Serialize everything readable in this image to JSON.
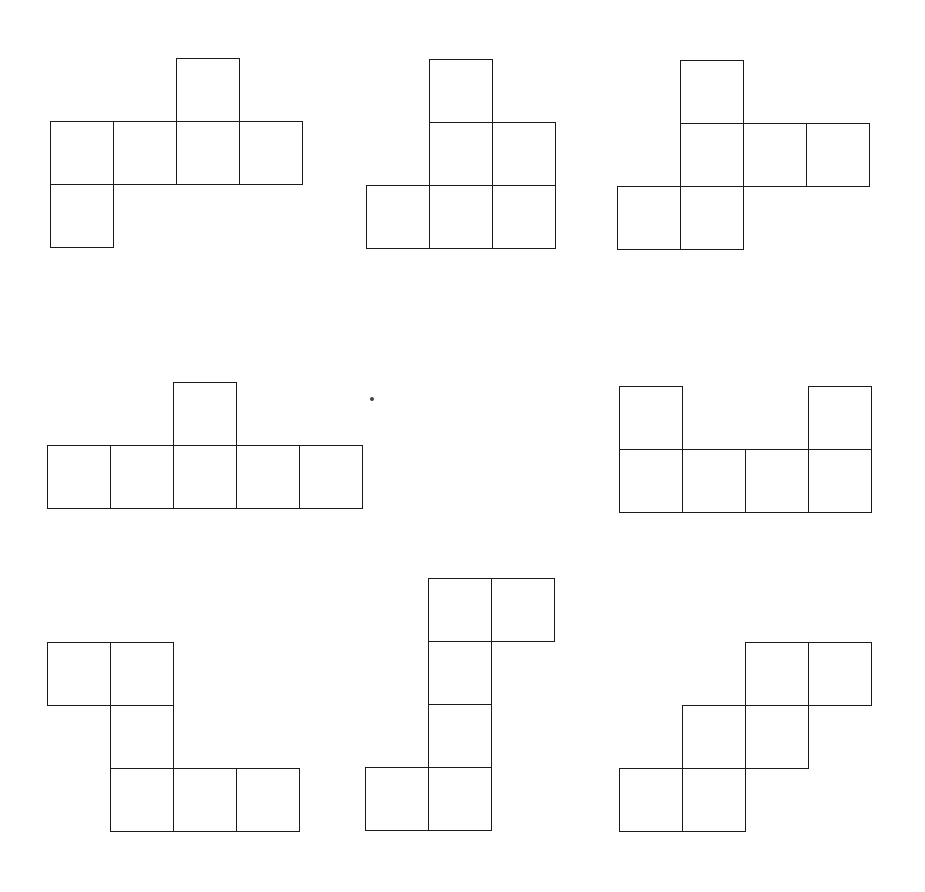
{
  "diagram": {
    "line_color": "#1a1a1a",
    "background": "#ffffff",
    "cell_size": 63,
    "figures": [
      {
        "id": "net-1",
        "x": 50,
        "y": 58,
        "cells": [
          [
            2,
            0
          ],
          [
            0,
            1
          ],
          [
            1,
            1
          ],
          [
            2,
            1
          ],
          [
            3,
            1
          ],
          [
            0,
            2
          ]
        ]
      },
      {
        "id": "net-2",
        "x": 366,
        "y": 59,
        "cells": [
          [
            1,
            0
          ],
          [
            1,
            1
          ],
          [
            2,
            1
          ],
          [
            0,
            2
          ],
          [
            1,
            2
          ],
          [
            2,
            2
          ]
        ]
      },
      {
        "id": "net-3",
        "x": 617,
        "y": 60,
        "cells": [
          [
            1,
            0
          ],
          [
            1,
            1
          ],
          [
            2,
            1
          ],
          [
            3,
            1
          ],
          [
            0,
            2
          ],
          [
            1,
            2
          ]
        ]
      },
      {
        "id": "net-4",
        "x": 47,
        "y": 382,
        "cells": [
          [
            2,
            0
          ],
          [
            0,
            1
          ],
          [
            1,
            1
          ],
          [
            2,
            1
          ],
          [
            3,
            1
          ],
          [
            4,
            1
          ]
        ]
      },
      {
        "id": "net-5",
        "x": 619,
        "y": 386,
        "cells": [
          [
            0,
            0
          ],
          [
            3,
            0
          ],
          [
            0,
            1
          ],
          [
            1,
            1
          ],
          [
            2,
            1
          ],
          [
            3,
            1
          ]
        ]
      },
      {
        "id": "net-6",
        "x": 47,
        "y": 579,
        "cells": [
          [
            0,
            1
          ],
          [
            1,
            1
          ],
          [
            1,
            2
          ],
          [
            1,
            3
          ],
          [
            2,
            3
          ],
          [
            3,
            3
          ]
        ]
      },
      {
        "id": "net-7",
        "x": 365,
        "y": 578,
        "cells": [
          [
            1,
            0
          ],
          [
            2,
            0
          ],
          [
            1,
            1
          ],
          [
            1,
            2
          ],
          [
            0,
            3
          ],
          [
            1,
            3
          ]
        ]
      },
      {
        "id": "net-8",
        "x": 619,
        "y": 579,
        "cells": [
          [
            2,
            1
          ],
          [
            3,
            1
          ],
          [
            1,
            2
          ],
          [
            2,
            2
          ],
          [
            0,
            3
          ],
          [
            1,
            3
          ]
        ]
      }
    ],
    "speck": {
      "x": 370,
      "y": 397
    }
  }
}
